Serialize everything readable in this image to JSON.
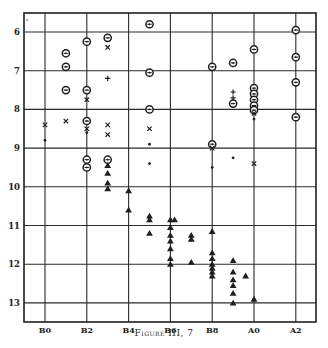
{
  "caption": "Figure III, 7",
  "colors": {
    "ink": "#1e1e1e",
    "grid": "#2a2a2a",
    "paper": "#ffffff"
  },
  "chart_data": {
    "type": "scatter",
    "title": "Figure III, 7",
    "xlabel": "Spectral type",
    "ylabel": "Magnitude",
    "x_categories": [
      "B0",
      "B2",
      "B4",
      "B6",
      "B8",
      "A0",
      "A2"
    ],
    "x_category_index": [
      0,
      2,
      4,
      6,
      8,
      10,
      12
    ],
    "y_ticks": [
      6,
      7,
      8,
      9,
      10,
      11,
      12,
      13
    ],
    "ylim": [
      5.5,
      13.5
    ],
    "y_inverted": true,
    "grid": true,
    "legend": "none",
    "marker_types": [
      "circle-cross",
      "x-mark",
      "plus",
      "dot",
      "triangle"
    ],
    "series": [
      {
        "name": "circle-cross",
        "points": [
          [
            1,
            6.55
          ],
          [
            1,
            6.9
          ],
          [
            1,
            7.5
          ],
          [
            2,
            6.25
          ],
          [
            2,
            7.5
          ],
          [
            2,
            8.3
          ],
          [
            2,
            9.3
          ],
          [
            2,
            9.5
          ],
          [
            3,
            6.15
          ],
          [
            3,
            9.3
          ],
          [
            5,
            5.8
          ],
          [
            5,
            7.05
          ],
          [
            5,
            8.0
          ],
          [
            8,
            6.9
          ],
          [
            8,
            8.9
          ],
          [
            9,
            6.8
          ],
          [
            9,
            7.85
          ],
          [
            10,
            6.45
          ],
          [
            10,
            7.45
          ],
          [
            10,
            7.6
          ],
          [
            10,
            7.75
          ],
          [
            10,
            7.9
          ],
          [
            10,
            8.02
          ],
          [
            12,
            5.95
          ],
          [
            12,
            6.65
          ],
          [
            12,
            7.3
          ],
          [
            12,
            8.2
          ]
        ]
      },
      {
        "name": "x-mark",
        "points": [
          [
            0,
            8.4
          ],
          [
            1,
            8.3
          ],
          [
            2,
            7.75
          ],
          [
            2,
            8.5
          ],
          [
            3,
            6.4
          ],
          [
            3,
            8.4
          ],
          [
            3,
            8.65
          ],
          [
            5,
            8.5
          ],
          [
            8,
            9.0
          ],
          [
            10,
            8.1
          ],
          [
            10,
            9.4
          ]
        ]
      },
      {
        "name": "plus",
        "points": [
          [
            3,
            7.2
          ],
          [
            9,
            7.55
          ],
          [
            9,
            7.7
          ]
        ]
      },
      {
        "name": "dot",
        "points": [
          [
            0,
            8.8
          ],
          [
            2,
            8.6
          ],
          [
            5,
            8.9
          ],
          [
            5,
            9.4
          ],
          [
            8,
            9.5
          ],
          [
            9,
            9.25
          ],
          [
            10,
            8.25
          ]
        ]
      },
      {
        "name": "triangle",
        "points": [
          [
            3,
            9.45
          ],
          [
            3,
            9.65
          ],
          [
            3,
            9.9
          ],
          [
            3,
            10.05
          ],
          [
            4,
            10.1
          ],
          [
            4,
            10.6
          ],
          [
            5,
            10.75
          ],
          [
            5,
            10.85
          ],
          [
            5,
            11.2
          ],
          [
            6,
            10.85
          ],
          [
            6.2,
            10.85
          ],
          [
            6,
            11.05
          ],
          [
            6,
            11.25
          ],
          [
            6,
            11.4
          ],
          [
            6,
            11.6
          ],
          [
            6,
            11.85
          ],
          [
            6,
            12.0
          ],
          [
            7,
            11.25
          ],
          [
            7,
            11.35
          ],
          [
            7,
            11.95
          ],
          [
            8,
            11.15
          ],
          [
            8,
            11.7
          ],
          [
            8,
            11.85
          ],
          [
            8,
            12.0
          ],
          [
            8,
            12.1
          ],
          [
            8,
            12.2
          ],
          [
            8,
            12.3
          ],
          [
            9,
            11.9
          ],
          [
            9,
            12.2
          ],
          [
            9,
            12.4
          ],
          [
            9,
            12.55
          ],
          [
            9,
            12.75
          ],
          [
            9,
            13.0
          ],
          [
            9.6,
            12.3
          ],
          [
            10,
            12.9
          ]
        ]
      }
    ]
  }
}
